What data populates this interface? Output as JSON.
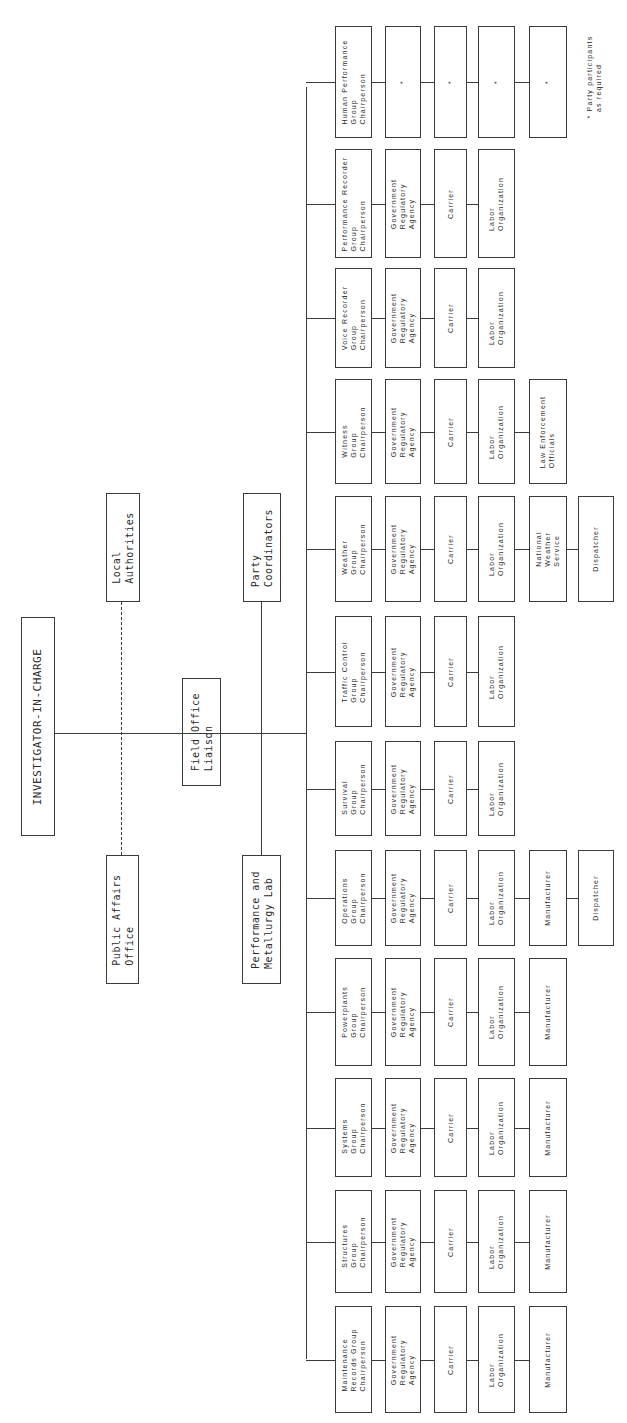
{
  "top": {
    "investigator": "INVESTIGATOR-IN-CHARGE",
    "local_authorities": "Local\nAuthorities",
    "public_affairs": "Public Affairs\nOffice",
    "field_office": "Field Office\nLiaison",
    "party_coordinators": "Party\nCoordinators",
    "perf_lab": "Performance and\nMetallurgy Lab"
  },
  "groups": [
    {
      "chair": "Human Performance\nGroup\nChairperson",
      "members": [
        "*",
        "*",
        "*",
        "*"
      ]
    },
    {
      "chair": "Performance Recorder\nGroup\nChairperson",
      "members": [
        "Government\nRegulatory\nAgency",
        "Carrier",
        "Labor\nOrganization"
      ]
    },
    {
      "chair": "Voice Recorder\nGroup\nChairperson",
      "members": [
        "Government\nRegulatory\nAgency",
        "Carrier",
        "Labor\nOrganization"
      ]
    },
    {
      "chair": "Witness\nGroup\nChairperson",
      "members": [
        "Government\nRegulatory\nAgency",
        "Carrier",
        "Labor\nOrganization",
        "Law Enforcement\nOfficials"
      ]
    },
    {
      "chair": "Weather\nGroup\nChairperson",
      "members": [
        "Government\nRegulatory\nAgency",
        "Carrier",
        "Labor\nOrganization",
        "National\nWeather\nService",
        "Dispatcher"
      ]
    },
    {
      "chair": "Traffic Control\nGroup\nChairperson",
      "members": [
        "Government\nRegulatory\nAgency",
        "Carrier",
        "Labor\nOrganization"
      ]
    },
    {
      "chair": "Survival\nGroup\nChairperson",
      "members": [
        "Government\nRegulatory\nAgency",
        "Carrier",
        "Labor\nOrganization"
      ]
    },
    {
      "chair": "Operations\nGroup\nChairperson",
      "members": [
        "Government\nRegulatory\nAgency",
        "Carrier",
        "Labor\nOrganization",
        "Manufacturer",
        "Dispatcher"
      ]
    },
    {
      "chair": "Powerplants\nGroup\nChairperson",
      "members": [
        "Government\nRegulatory\nAgency",
        "Carrier",
        "Labor\nOrganization",
        "Manufacturer"
      ]
    },
    {
      "chair": "Systems\nGroup\nChairperson",
      "members": [
        "Government\nRegulatory\nAgency",
        "Carrier",
        "Labor\nOrganization",
        "Manufacturer"
      ]
    },
    {
      "chair": "Structures\nGroup\nChairperson",
      "members": [
        "Government\nRegulatory\nAgency",
        "Carrier",
        "Labor\nOrganization",
        "Manufacturer"
      ]
    },
    {
      "chair": "Maintenance\nRecords Group\nChairperson",
      "members": [
        "Government\nRegulatory\nAgency",
        "Carrier",
        "Labor\nOrganization",
        "Manufacturer"
      ]
    }
  ],
  "footnote": "* Party participants\n  as required"
}
